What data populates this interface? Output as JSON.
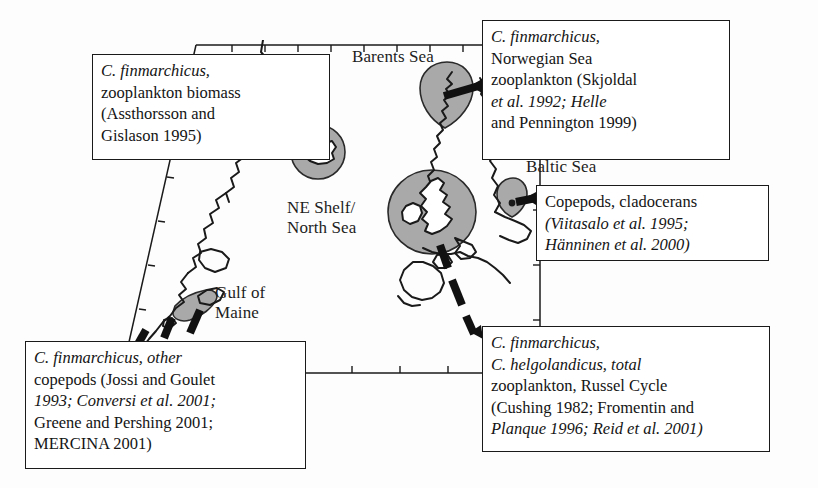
{
  "figure": {
    "type": "map",
    "colors": {
      "region_fill": "#a9a9a9",
      "outline": "#1a1a1a",
      "background": "#ffffff",
      "text": "#141414"
    }
  },
  "map": {
    "place_labels": [
      {
        "id": "barents",
        "text": "Barents Sea"
      },
      {
        "id": "iceland",
        "text": "Iceland"
      },
      {
        "id": "neshelf",
        "text": "NE Shelf/\nNorth Sea"
      },
      {
        "id": "gulfmaine",
        "text": "Gulf of\nMaine"
      },
      {
        "id": "baltic",
        "text": "Baltic Sea"
      }
    ],
    "regions": [
      {
        "id": "iceland-region",
        "label": "Iceland",
        "shape": "circle"
      },
      {
        "id": "norwegian-region",
        "label": "Norwegian Sea",
        "shape": "teardrop"
      },
      {
        "id": "northsea-region",
        "label": "NE Shelf/North Sea",
        "shape": "ellipse"
      },
      {
        "id": "baltic-region",
        "label": "Baltic Sea",
        "shape": "teardrop"
      },
      {
        "id": "gulfmaine-region",
        "label": "Gulf of Maine",
        "shape": "blob"
      }
    ]
  },
  "callouts": {
    "iceland": {
      "lines": [
        "C. finmarchicus,",
        "zooplankton biomass",
        "(Assthorsson and",
        "Gislason 1995)"
      ],
      "species_italic": "C. finmarchicus",
      "region": "Iceland"
    },
    "norwegian": {
      "lines": [
        "C. finmarchicus,",
        "Norwegian Sea",
        "zooplankton (Skjoldal",
        "et al. 1992; Helle",
        "and Pennington 1999)"
      ],
      "species_italic": "C. finmarchicus",
      "region": "Norwegian Sea"
    },
    "baltic": {
      "lines": [
        "Copepods, cladocerans",
        "(Viitasalo et al. 1995;",
        "Hänninen et al. 2000)"
      ],
      "region": "Baltic Sea"
    },
    "gulfmaine": {
      "lines": [
        "C. finmarchicus, other",
        "copepods (Jossi and Goulet",
        "1993; Conversi et al. 2001;",
        "Greene and Pershing 2001;",
        "MERCINA 2001)"
      ],
      "species_italic": "C. finmarchicus",
      "region": "Gulf of Maine"
    },
    "russel": {
      "lines": [
        "C. finmarchicus,",
        "C. helgolandicus, total",
        "zooplankton, Russel Cycle",
        "(Cushing 1982; Fromentin and",
        "Planque 1996; Reid et al. 2001)"
      ],
      "species_italic": "C. finmarchicus, C. helgolandicus",
      "region": "NE Shelf/North Sea"
    }
  }
}
